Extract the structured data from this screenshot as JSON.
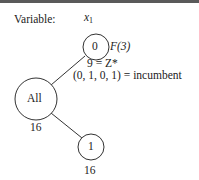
{
  "header": {
    "variable_label": "Variable:",
    "variable_name": "x",
    "variable_subscript": "1"
  },
  "nodes": {
    "root": {
      "label": "All",
      "bound": "16"
    },
    "branch0": {
      "label": "0",
      "annotation": "F(3)",
      "z_line": "9 = Z*",
      "incumbent_line": "(0, 1, 0, 1) = incumbent"
    },
    "branch1": {
      "label": "1",
      "bound": "16"
    }
  },
  "colors": {
    "stroke": "#333333",
    "text": "#222222",
    "border": "#5a5a5a"
  }
}
